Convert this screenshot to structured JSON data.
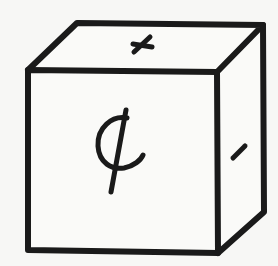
{
  "figure": {
    "type": "hand-drawn cube with symbols on faces",
    "colors": {
      "background": "#f7f7f5",
      "ink": "#1a1a1a",
      "face": "#fafaf8"
    }
  },
  "cube": {
    "faces": [
      {
        "name": "front",
        "symbol": "¢",
        "symbol_name": "cent-sign"
      },
      {
        "name": "top",
        "symbol": "+",
        "symbol_name": "plus-sign-tilted"
      },
      {
        "name": "right",
        "symbol": "-",
        "symbol_name": "minus-sign-tilted"
      }
    ]
  }
}
